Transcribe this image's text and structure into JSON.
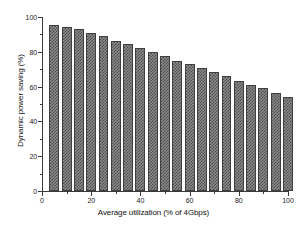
{
  "chart_data": {
    "type": "bar",
    "title": "",
    "subtitle": "",
    "xlabel": "Average utilization (% of 4Gbps)",
    "ylabel": "Dynamic power saving (%)",
    "xlim": [
      0,
      100
    ],
    "ylim": [
      0,
      100
    ],
    "grid": false,
    "legend": null,
    "bar_fill_pattern": "checkerboard",
    "bar_fill_color": "#8c8c8c",
    "bar_pattern_color": "#4a4a4a",
    "bar_edge_color": "#3f3f3f",
    "axis_color": "#3a3a3a",
    "background_color": "#ffffff",
    "x_major_ticks": [
      0,
      20,
      40,
      60,
      80,
      100
    ],
    "x_minor_ticks": [
      10,
      30,
      50,
      70,
      90
    ],
    "y_major_ticks": [
      0,
      20,
      40,
      60,
      80,
      100
    ],
    "y_minor_ticks": [
      10,
      30,
      50,
      70,
      90
    ],
    "categories": [
      5,
      10,
      15,
      20,
      25,
      30,
      35,
      40,
      45,
      50,
      55,
      60,
      65,
      70,
      75,
      80,
      85,
      90,
      95,
      100
    ],
    "x": [
      5,
      10,
      15,
      20,
      25,
      30,
      35,
      40,
      45,
      50,
      55,
      60,
      65,
      70,
      75,
      80,
      85,
      90,
      95,
      100
    ],
    "values": [
      95.5,
      94.5,
      93.0,
      91.0,
      89.0,
      86.5,
      84.5,
      82.0,
      80.0,
      77.5,
      75.0,
      73.0,
      70.5,
      68.5,
      66.0,
      63.5,
      61.0,
      59.0,
      56.5,
      54.0
    ],
    "series": [
      {
        "name": "Dynamic power saving",
        "values": [
          95.5,
          94.5,
          93.0,
          91.0,
          89.0,
          86.5,
          84.5,
          82.0,
          80.0,
          77.5,
          75.0,
          73.0,
          70.5,
          68.5,
          66.0,
          63.5,
          61.0,
          59.0,
          56.5,
          54.0
        ]
      }
    ]
  }
}
